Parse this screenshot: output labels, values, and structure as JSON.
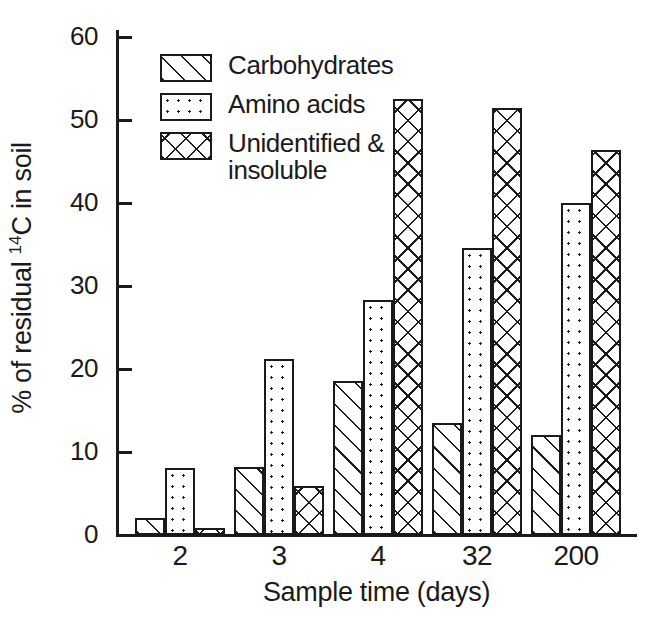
{
  "chart_data": {
    "type": "bar",
    "title": "",
    "xlabel": "Sample time (days)",
    "ylabel": "% of residual 14C in soil",
    "ylabel_prefix": "% of residual ",
    "ylabel_superscript": "14",
    "ylabel_suffix": "C in soil",
    "categories": [
      "2",
      "3",
      "4",
      "32",
      "200"
    ],
    "ylim": [
      0,
      60
    ],
    "ytick_labels": [
      "0",
      "10",
      "20",
      "30",
      "40",
      "50",
      "60"
    ],
    "ytick_values": [
      0,
      10,
      20,
      30,
      40,
      50,
      60
    ],
    "grid": false,
    "legend_position": "upper-left-inside",
    "series": [
      {
        "name": "Carbohydrates",
        "pattern": "diagonal-hatch",
        "values": [
          2.0,
          8.2,
          18.5,
          13.5,
          12.0
        ]
      },
      {
        "name": "Amino acids",
        "pattern": "dotted",
        "values": [
          8.1,
          21.2,
          28.3,
          34.6,
          40.0
        ]
      },
      {
        "name": "Unidentified &\ninsoluble",
        "pattern": "cross-hatch",
        "values": [
          0.9,
          5.9,
          52.5,
          51.4,
          46.4
        ]
      }
    ],
    "colors": {
      "ink": "#1a1a1a",
      "background": "#ffffff"
    }
  }
}
